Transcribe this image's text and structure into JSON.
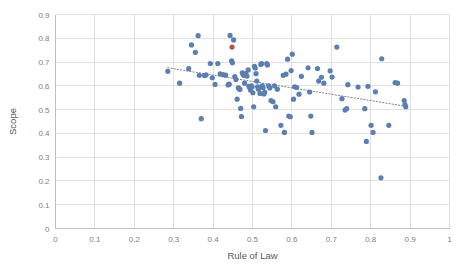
{
  "chart_data": {
    "type": "scatter",
    "title": "",
    "xlabel": "Rule of Law",
    "ylabel": "Scope",
    "xlim": [
      0,
      1
    ],
    "ylim": [
      0,
      0.9
    ],
    "xticks": [
      "0",
      "0.1",
      "0.2",
      "0.3",
      "0.4",
      "0.5",
      "0.6",
      "0.7",
      "0.8",
      "0.9",
      "1"
    ],
    "yticks": [
      "0",
      "0.1",
      "0.2",
      "0.3",
      "0.4",
      "0.5",
      "0.6",
      "0.7",
      "0.8",
      "0.9"
    ],
    "grid": "both",
    "legend": "none",
    "colors": {
      "point": "#5b7fb0",
      "highlight_point": "#c0504d",
      "trendline": "#808080",
      "gridline": "#d9d9d9",
      "axis": "#bfbfbf",
      "tick_text": "#808080",
      "label_text": "#595959"
    },
    "point_radius": 2.6,
    "trendline": {
      "style": "dotted",
      "x1": 0.285,
      "y1": 0.676,
      "x2": 0.893,
      "y2": 0.513
    },
    "series": [
      {
        "name": "Countries",
        "color": "#5b7fb0",
        "points": [
          [
            0.285,
            0.661
          ],
          [
            0.315,
            0.611
          ],
          [
            0.338,
            0.672
          ],
          [
            0.345,
            0.772
          ],
          [
            0.355,
            0.741
          ],
          [
            0.362,
            0.811
          ],
          [
            0.365,
            0.644
          ],
          [
            0.37,
            0.462
          ],
          [
            0.378,
            0.643
          ],
          [
            0.382,
            0.646
          ],
          [
            0.393,
            0.694
          ],
          [
            0.398,
            0.634
          ],
          [
            0.405,
            0.606
          ],
          [
            0.412,
            0.694
          ],
          [
            0.418,
            0.65
          ],
          [
            0.425,
            0.647
          ],
          [
            0.432,
            0.645
          ],
          [
            0.438,
            0.604
          ],
          [
            0.441,
            0.607
          ],
          [
            0.443,
            0.812
          ],
          [
            0.447,
            0.705
          ],
          [
            0.449,
            0.697
          ],
          [
            0.452,
            0.793
          ],
          [
            0.455,
            0.639
          ],
          [
            0.458,
            0.627
          ],
          [
            0.461,
            0.544
          ],
          [
            0.464,
            0.592
          ],
          [
            0.466,
            0.588
          ],
          [
            0.468,
            0.585
          ],
          [
            0.47,
            0.505
          ],
          [
            0.472,
            0.471
          ],
          [
            0.474,
            0.655
          ],
          [
            0.476,
            0.649
          ],
          [
            0.478,
            0.644
          ],
          [
            0.48,
            0.611
          ],
          [
            0.483,
            0.653
          ],
          [
            0.486,
            0.641
          ],
          [
            0.489,
            0.667
          ],
          [
            0.491,
            0.598
          ],
          [
            0.493,
            0.592
          ],
          [
            0.495,
            0.582
          ],
          [
            0.497,
            0.6
          ],
          [
            0.499,
            0.596
          ],
          [
            0.501,
            0.571
          ],
          [
            0.503,
            0.512
          ],
          [
            0.505,
            0.682
          ],
          [
            0.507,
            0.675
          ],
          [
            0.509,
            0.651
          ],
          [
            0.511,
            0.62
          ],
          [
            0.513,
            0.596
          ],
          [
            0.515,
            0.586
          ],
          [
            0.517,
            0.594
          ],
          [
            0.519,
            0.568
          ],
          [
            0.521,
            0.69
          ],
          [
            0.523,
            0.694
          ],
          [
            0.525,
            0.6
          ],
          [
            0.527,
            0.592
          ],
          [
            0.529,
            0.566
          ],
          [
            0.531,
            0.573
          ],
          [
            0.533,
            0.412
          ],
          [
            0.536,
            0.693
          ],
          [
            0.538,
            0.688
          ],
          [
            0.541,
            0.6
          ],
          [
            0.544,
            0.591
          ],
          [
            0.547,
            0.538
          ],
          [
            0.552,
            0.533
          ],
          [
            0.556,
            0.6
          ],
          [
            0.559,
            0.512
          ],
          [
            0.563,
            0.586
          ],
          [
            0.572,
            0.434
          ],
          [
            0.578,
            0.644
          ],
          [
            0.581,
            0.404
          ],
          [
            0.585,
            0.649
          ],
          [
            0.589,
            0.712
          ],
          [
            0.592,
            0.473
          ],
          [
            0.596,
            0.47
          ],
          [
            0.598,
            0.664
          ],
          [
            0.601,
            0.733
          ],
          [
            0.604,
            0.544
          ],
          [
            0.607,
            0.596
          ],
          [
            0.612,
            0.593
          ],
          [
            0.618,
            0.565
          ],
          [
            0.624,
            0.64
          ],
          [
            0.641,
            0.676
          ],
          [
            0.645,
            0.574
          ],
          [
            0.648,
            0.473
          ],
          [
            0.651,
            0.404
          ],
          [
            0.665,
            0.673
          ],
          [
            0.668,
            0.62
          ],
          [
            0.675,
            0.636
          ],
          [
            0.681,
            0.611
          ],
          [
            0.697,
            0.663
          ],
          [
            0.702,
            0.637
          ],
          [
            0.714,
            0.763
          ],
          [
            0.727,
            0.546
          ],
          [
            0.735,
            0.498
          ],
          [
            0.739,
            0.504
          ],
          [
            0.742,
            0.605
          ],
          [
            0.768,
            0.595
          ],
          [
            0.785,
            0.504
          ],
          [
            0.789,
            0.366
          ],
          [
            0.793,
            0.598
          ],
          [
            0.801,
            0.434
          ],
          [
            0.806,
            0.404
          ],
          [
            0.812,
            0.575
          ],
          [
            0.826,
            0.213
          ],
          [
            0.828,
            0.714
          ],
          [
            0.846,
            0.434
          ],
          [
            0.862,
            0.614
          ],
          [
            0.868,
            0.611
          ],
          [
            0.885,
            0.538
          ],
          [
            0.887,
            0.521
          ],
          [
            0.889,
            0.512
          ]
        ]
      },
      {
        "name": "Highlighted",
        "color": "#c0504d",
        "points": [
          [
            0.448,
            0.763
          ]
        ]
      }
    ]
  }
}
